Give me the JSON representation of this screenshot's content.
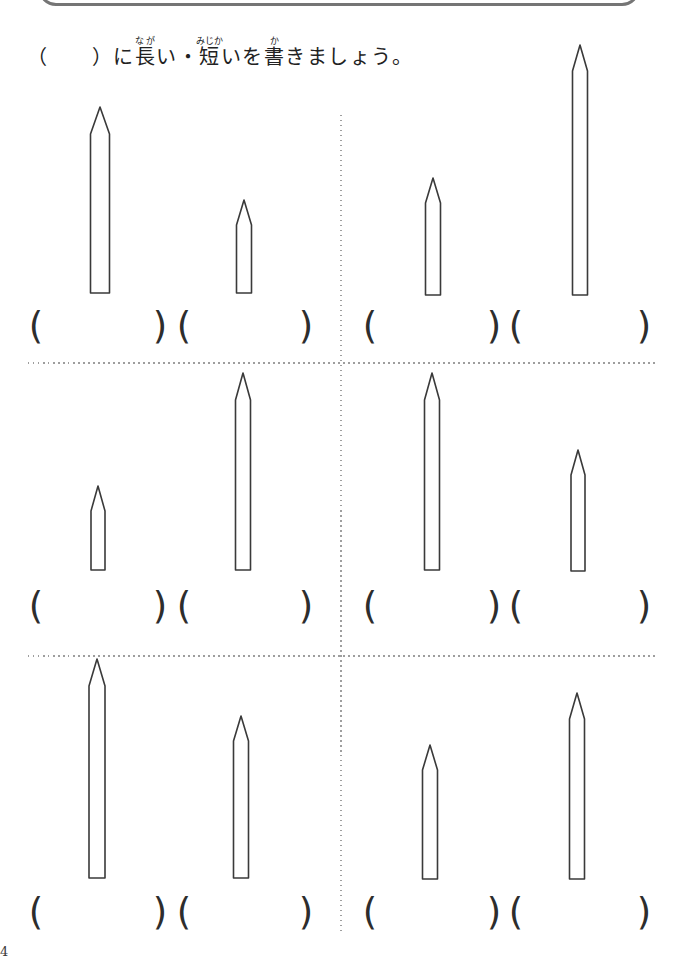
{
  "page": {
    "width": 681,
    "height": 960,
    "background": "#ffffff",
    "ink_color": "#3a3a3a",
    "divider_color": "#9e9e9e",
    "page_number": "4"
  },
  "title_box": {
    "left": 38,
    "top": -54,
    "width": 602,
    "height": 60,
    "radius": 18,
    "border_color": "#757575",
    "note_visible_part": "bottom edge of rounded header box, title cut off"
  },
  "instruction": {
    "prefix": "（　　）に",
    "ruby_segments": [
      {
        "base": "長",
        "ruby": "なが",
        "suffix": "い・"
      },
      {
        "base": "短",
        "ruby": "みじか",
        "suffix": "いを"
      },
      {
        "base": "書",
        "ruby": "か",
        "suffix": "きましょう。"
      }
    ],
    "full_text": "（　　）に長い・短いを書きましょう。"
  },
  "worksheet": {
    "paren_open": "(",
    "paren_close": ")",
    "answer_blank": "",
    "dividers": [
      {
        "type": "v",
        "x": 340,
        "y1": 115,
        "y2": 933
      },
      {
        "type": "h",
        "y": 362,
        "x1": 28,
        "x2": 658
      },
      {
        "type": "h",
        "y": 655,
        "x1": 28,
        "x2": 658
      }
    ],
    "cells": [
      {
        "name": "top-left",
        "paren_y": 326,
        "paren_pairs": [
          {
            "open_x": 36,
            "close_x": 160
          },
          {
            "open_x": 184,
            "close_x": 306
          }
        ],
        "pencils": [
          {
            "cx": 100,
            "tip_y": 107,
            "bottom_y": 293,
            "width": 19,
            "tip_h": 27,
            "relative_length": "long"
          },
          {
            "cx": 244,
            "tip_y": 200,
            "bottom_y": 293,
            "width": 15,
            "tip_h": 25,
            "relative_length": "short"
          }
        ]
      },
      {
        "name": "top-right",
        "paren_y": 326,
        "paren_pairs": [
          {
            "open_x": 370,
            "close_x": 494
          },
          {
            "open_x": 516,
            "close_x": 644
          }
        ],
        "pencils": [
          {
            "cx": 433,
            "tip_y": 178,
            "bottom_y": 295,
            "width": 15,
            "tip_h": 25,
            "relative_length": "short"
          },
          {
            "cx": 580,
            "tip_y": 45,
            "bottom_y": 295,
            "width": 15,
            "tip_h": 26,
            "relative_length": "long"
          }
        ]
      },
      {
        "name": "middle-left",
        "paren_y": 606,
        "paren_pairs": [
          {
            "open_x": 36,
            "close_x": 160
          },
          {
            "open_x": 184,
            "close_x": 306
          }
        ],
        "pencils": [
          {
            "cx": 98,
            "tip_y": 486,
            "bottom_y": 570,
            "width": 14,
            "tip_h": 25,
            "relative_length": "short"
          },
          {
            "cx": 243,
            "tip_y": 373,
            "bottom_y": 570,
            "width": 15,
            "tip_h": 27,
            "relative_length": "long"
          }
        ]
      },
      {
        "name": "middle-right",
        "paren_y": 606,
        "paren_pairs": [
          {
            "open_x": 370,
            "close_x": 494
          },
          {
            "open_x": 516,
            "close_x": 644
          }
        ],
        "pencils": [
          {
            "cx": 432,
            "tip_y": 373,
            "bottom_y": 570,
            "width": 15,
            "tip_h": 27,
            "relative_length": "long"
          },
          {
            "cx": 578,
            "tip_y": 450,
            "bottom_y": 571,
            "width": 14,
            "tip_h": 25,
            "relative_length": "short"
          }
        ]
      },
      {
        "name": "bottom-left",
        "paren_y": 912,
        "paren_pairs": [
          {
            "open_x": 36,
            "close_x": 160
          },
          {
            "open_x": 184,
            "close_x": 306
          }
        ],
        "pencils": [
          {
            "cx": 97,
            "tip_y": 659,
            "bottom_y": 878,
            "width": 16,
            "tip_h": 27,
            "relative_length": "long"
          },
          {
            "cx": 241,
            "tip_y": 716,
            "bottom_y": 878,
            "width": 15,
            "tip_h": 25,
            "relative_length": "short"
          }
        ]
      },
      {
        "name": "bottom-right",
        "paren_y": 912,
        "paren_pairs": [
          {
            "open_x": 370,
            "close_x": 494
          },
          {
            "open_x": 516,
            "close_x": 644
          }
        ],
        "pencils": [
          {
            "cx": 430,
            "tip_y": 745,
            "bottom_y": 879,
            "width": 15,
            "tip_h": 25,
            "relative_length": "short"
          },
          {
            "cx": 577,
            "tip_y": 693,
            "bottom_y": 879,
            "width": 15,
            "tip_h": 26,
            "relative_length": "long"
          }
        ]
      }
    ]
  }
}
